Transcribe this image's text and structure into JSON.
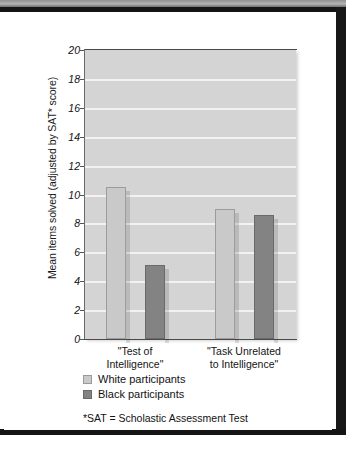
{
  "figure": {
    "ylabel": "Mean items solved (adjusted by SAT* score)",
    "footnote": "*SAT = Scholastic Assessment Test"
  },
  "legend": {
    "items": [
      {
        "label": "White participants",
        "color": "#c9c9c9",
        "swatch": "light"
      },
      {
        "label": "Black participants",
        "color": "#838383",
        "swatch": "dark"
      }
    ]
  },
  "axis": {
    "ticks": [
      "20",
      "18",
      "16",
      "14",
      "12",
      "10",
      "8",
      "6",
      "4",
      "2",
      "0"
    ]
  },
  "categories": [
    {
      "line1": "\"Test of",
      "line2": "Intelligence\""
    },
    {
      "line1": "\"Task Unrelated",
      "line2": "to Intelligence\""
    }
  ],
  "chart_data": {
    "type": "bar",
    "title": "",
    "xlabel": "",
    "ylabel": "Mean items solved (adjusted by SAT* score)",
    "categories": [
      "\"Test of Intelligence\"",
      "\"Task Unrelated to Intelligence\""
    ],
    "series": [
      {
        "name": "White participants",
        "color": "#c9c9c9",
        "values": [
          10.5,
          9.0
        ]
      },
      {
        "name": "Black participants",
        "color": "#838383",
        "values": [
          5.1,
          8.6
        ]
      }
    ],
    "ylim": [
      0,
      20
    ],
    "ytick_step": 2,
    "yticks": [
      0,
      2,
      4,
      6,
      8,
      10,
      12,
      14,
      16,
      18,
      20
    ],
    "grid": true,
    "grid_axis": "y",
    "legend_position": "below-axes-left",
    "annotations": [
      "*SAT = Scholastic Assessment Test"
    ],
    "plot_background": "#d4d4d4",
    "gridline_color": "#f2f2f2"
  }
}
